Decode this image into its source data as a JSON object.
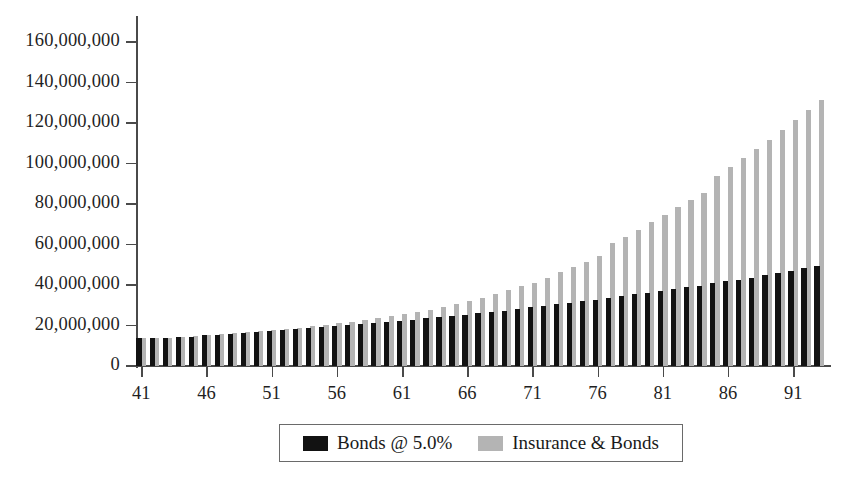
{
  "chart_data": {
    "type": "bar",
    "title": "",
    "subtitle": "",
    "xlabel": "",
    "ylabel": "",
    "grid": false,
    "legend_position": "bottom",
    "xlim": [
      41,
      93
    ],
    "ylim": [
      0,
      160000000
    ],
    "y_ticks": [
      0,
      20000000,
      40000000,
      60000000,
      80000000,
      100000000,
      120000000,
      140000000,
      160000000
    ],
    "y_tick_labels": [
      "0",
      "20,000,000",
      "40,000,000",
      "60,000,000",
      "80,000,000",
      "100,000,000",
      "120,000,000",
      "140,000,000",
      "160,000,000"
    ],
    "x_ticks": [
      41,
      46,
      51,
      56,
      61,
      66,
      71,
      76,
      81,
      86,
      91
    ],
    "x_tick_labels": [
      "41",
      "46",
      "51",
      "56",
      "61",
      "66",
      "71",
      "76",
      "81",
      "86",
      "91"
    ],
    "categories": [
      41,
      42,
      43,
      44,
      45,
      46,
      47,
      48,
      49,
      50,
      51,
      52,
      53,
      54,
      55,
      56,
      57,
      58,
      59,
      60,
      61,
      62,
      63,
      64,
      65,
      66,
      67,
      68,
      69,
      70,
      71,
      72,
      73,
      74,
      75,
      76,
      77,
      78,
      79,
      80,
      81,
      82,
      83,
      84,
      85,
      86,
      87,
      88,
      89,
      90,
      91,
      92,
      93
    ],
    "series": [
      {
        "name": "Bonds @ 5.0%",
        "color": "#121212",
        "values": [
          13700000,
          13900000,
          14000000,
          14200000,
          14500000,
          15100000,
          15400000,
          15800000,
          16200000,
          16600000,
          17200000,
          17600000,
          18100000,
          18600000,
          19200000,
          19700000,
          20200000,
          20800000,
          21300000,
          21800000,
          22400000,
          22900000,
          23500000,
          24100000,
          24700000,
          25300000,
          26000000,
          26700000,
          27400000,
          28100000,
          28900000,
          29700000,
          30500000,
          31300000,
          32000000,
          32800000,
          33600000,
          34500000,
          35400000,
          36200000,
          37000000,
          37900000,
          38800000,
          39700000,
          40800000,
          41800000,
          42700000,
          43700000,
          44800000,
          45900000,
          47000000,
          48300000,
          49600000
        ]
      },
      {
        "name": "Insurance & Bonds",
        "color": "#b4b4b4",
        "values": [
          13600000,
          13800000,
          14000000,
          14300000,
          14800000,
          15500000,
          15900000,
          16300000,
          16800000,
          17300000,
          17800000,
          18400000,
          19000000,
          19700000,
          20400000,
          21100000,
          21900000,
          22700000,
          23600000,
          24500000,
          25500000,
          26600000,
          27800000,
          29100000,
          30500000,
          32000000,
          33600000,
          35400000,
          37300000,
          39400000,
          40800000,
          43500000,
          46400000,
          49000000,
          51500000,
          54400000,
          60600000,
          63500000,
          67300000,
          71000000,
          74700000,
          78400000,
          82000000,
          85500000,
          94000000,
          98400000,
          102600000,
          107400000,
          111600000,
          116500000,
          121400000,
          126400000,
          131500000
        ]
      }
    ]
  },
  "legend": {
    "items": [
      {
        "label": "Bonds @ 5.0%",
        "swatch": "dark-swatch-icon"
      },
      {
        "label": "Insurance & Bonds",
        "swatch": "light-swatch-icon"
      }
    ]
  }
}
